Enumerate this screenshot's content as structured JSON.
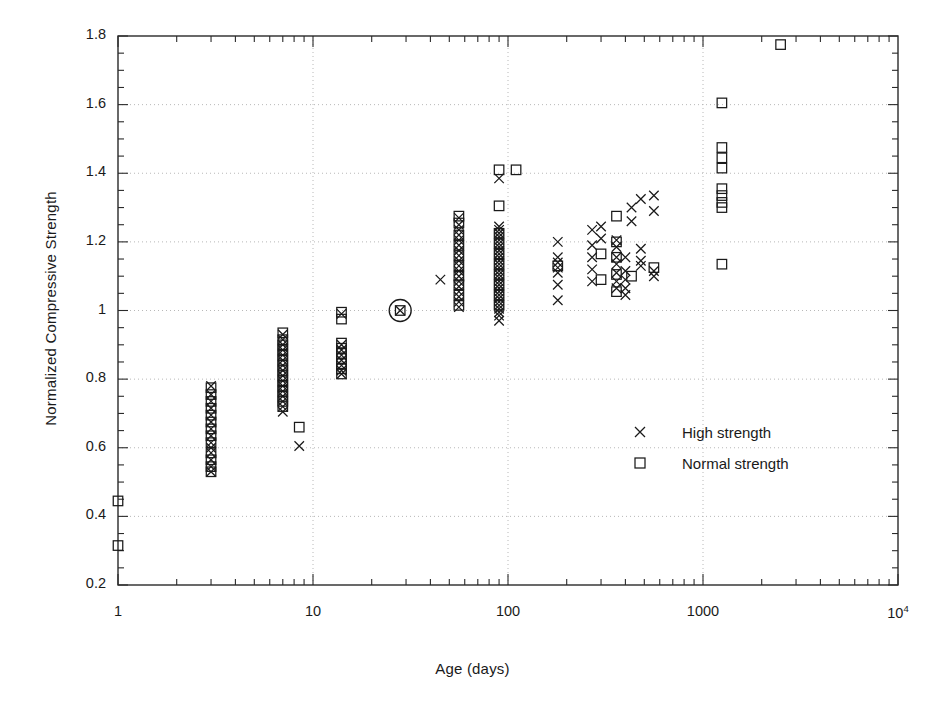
{
  "chart_data": {
    "type": "scatter",
    "title": "",
    "xlabel": "Age (days)",
    "ylabel": "Normalized Compressive Strength",
    "xscale": "log",
    "yscale": "linear",
    "xlim": [
      1,
      10000
    ],
    "ylim": [
      0.2,
      1.8
    ],
    "grid": true,
    "grid_style": "dotted",
    "legend_position": "center-right",
    "xtick_labels": [
      "1",
      "10",
      "100",
      "1000",
      "10",
      "4"
    ],
    "xticks": [
      1,
      10,
      100,
      1000,
      10000
    ],
    "yticks": [
      0.2,
      0.4,
      0.6,
      0.8,
      1.0,
      1.2,
      1.4,
      1.6,
      1.8
    ],
    "ytick_labels": [
      "0.2",
      "0.4",
      "0.6",
      "0.8",
      "1",
      "1.2",
      "1.4",
      "1.6",
      "1.8"
    ],
    "ytick_minor_step": 0.05,
    "annotations": [
      {
        "label": "reference-point-circle",
        "x": 28,
        "y": 1.0,
        "note": "circled 28-day normalization point"
      }
    ],
    "series": [
      {
        "name": "High strength",
        "marker": "x",
        "color": "#1a1a1a",
        "points": [
          [
            3,
            0.78
          ],
          [
            3,
            0.755
          ],
          [
            3,
            0.735
          ],
          [
            3,
            0.715
          ],
          [
            3,
            0.695
          ],
          [
            3,
            0.675
          ],
          [
            3,
            0.655
          ],
          [
            3,
            0.635
          ],
          [
            3,
            0.615
          ],
          [
            3,
            0.6
          ],
          [
            3,
            0.585
          ],
          [
            3,
            0.565
          ],
          [
            3,
            0.545
          ],
          [
            3,
            0.53
          ],
          [
            7,
            0.93
          ],
          [
            7,
            0.915
          ],
          [
            7,
            0.9
          ],
          [
            7,
            0.885
          ],
          [
            7,
            0.87
          ],
          [
            7,
            0.855
          ],
          [
            7,
            0.84
          ],
          [
            7,
            0.825
          ],
          [
            7,
            0.81
          ],
          [
            7,
            0.795
          ],
          [
            7,
            0.78
          ],
          [
            7,
            0.765
          ],
          [
            7,
            0.75
          ],
          [
            7,
            0.735
          ],
          [
            7,
            0.72
          ],
          [
            7,
            0.705
          ],
          [
            8.5,
            0.605
          ],
          [
            14,
            0.99
          ],
          [
            14,
            0.9
          ],
          [
            14,
            0.885
          ],
          [
            14,
            0.87
          ],
          [
            14,
            0.855
          ],
          [
            14,
            0.84
          ],
          [
            14,
            0.825
          ],
          [
            14,
            0.815
          ],
          [
            28,
            1.0
          ],
          [
            45,
            1.09
          ],
          [
            56,
            1.27
          ],
          [
            56,
            1.25
          ],
          [
            56,
            1.235
          ],
          [
            56,
            1.22
          ],
          [
            56,
            1.205
          ],
          [
            56,
            1.19
          ],
          [
            56,
            1.175
          ],
          [
            56,
            1.16
          ],
          [
            56,
            1.145
          ],
          [
            56,
            1.13
          ],
          [
            56,
            1.115
          ],
          [
            56,
            1.1
          ],
          [
            56,
            1.085
          ],
          [
            56,
            1.07
          ],
          [
            56,
            1.055
          ],
          [
            56,
            1.04
          ],
          [
            56,
            1.025
          ],
          [
            56,
            1.01
          ],
          [
            90,
            1.385
          ],
          [
            90,
            1.245
          ],
          [
            90,
            1.235
          ],
          [
            90,
            1.225
          ],
          [
            90,
            1.215
          ],
          [
            90,
            1.205
          ],
          [
            90,
            1.195
          ],
          [
            90,
            1.185
          ],
          [
            90,
            1.175
          ],
          [
            90,
            1.165
          ],
          [
            90,
            1.155
          ],
          [
            90,
            1.145
          ],
          [
            90,
            1.135
          ],
          [
            90,
            1.125
          ],
          [
            90,
            1.115
          ],
          [
            90,
            1.105
          ],
          [
            90,
            1.095
          ],
          [
            90,
            1.085
          ],
          [
            90,
            1.075
          ],
          [
            90,
            1.065
          ],
          [
            90,
            1.055
          ],
          [
            90,
            1.045
          ],
          [
            90,
            1.035
          ],
          [
            90,
            1.025
          ],
          [
            90,
            1.015
          ],
          [
            90,
            1.005
          ],
          [
            90,
            0.995
          ],
          [
            90,
            0.985
          ],
          [
            90,
            0.97
          ],
          [
            180,
            1.2
          ],
          [
            180,
            1.155
          ],
          [
            180,
            1.14
          ],
          [
            180,
            1.125
          ],
          [
            180,
            1.11
          ],
          [
            180,
            1.075
          ],
          [
            180,
            1.03
          ],
          [
            270,
            1.235
          ],
          [
            270,
            1.19
          ],
          [
            270,
            1.155
          ],
          [
            270,
            1.12
          ],
          [
            270,
            1.085
          ],
          [
            300,
            1.245
          ],
          [
            300,
            1.21
          ],
          [
            360,
            1.205
          ],
          [
            360,
            1.185
          ],
          [
            360,
            1.155
          ],
          [
            360,
            1.135
          ],
          [
            360,
            1.11
          ],
          [
            360,
            1.085
          ],
          [
            360,
            1.065
          ],
          [
            400,
            1.155
          ],
          [
            400,
            1.115
          ],
          [
            400,
            1.09
          ],
          [
            400,
            1.065
          ],
          [
            400,
            1.045
          ],
          [
            430,
            1.3
          ],
          [
            430,
            1.26
          ],
          [
            480,
            1.325
          ],
          [
            480,
            1.18
          ],
          [
            480,
            1.145
          ],
          [
            480,
            1.13
          ],
          [
            560,
            1.335
          ],
          [
            560,
            1.29
          ],
          [
            560,
            1.115
          ],
          [
            560,
            1.1
          ]
        ]
      },
      {
        "name": "Normal strength",
        "marker": "square",
        "color": "#1a1a1a",
        "points": [
          [
            1,
            0.445
          ],
          [
            1,
            0.315
          ],
          [
            3,
            0.775
          ],
          [
            3,
            0.755
          ],
          [
            3,
            0.735
          ],
          [
            3,
            0.715
          ],
          [
            3,
            0.695
          ],
          [
            3,
            0.675
          ],
          [
            3,
            0.655
          ],
          [
            3,
            0.635
          ],
          [
            3,
            0.615
          ],
          [
            3,
            0.585
          ],
          [
            3,
            0.565
          ],
          [
            3,
            0.545
          ],
          [
            3,
            0.53
          ],
          [
            7,
            0.935
          ],
          [
            7,
            0.915
          ],
          [
            7,
            0.9
          ],
          [
            7,
            0.885
          ],
          [
            7,
            0.87
          ],
          [
            7,
            0.855
          ],
          [
            7,
            0.84
          ],
          [
            7,
            0.825
          ],
          [
            7,
            0.81
          ],
          [
            7,
            0.795
          ],
          [
            7,
            0.78
          ],
          [
            7,
            0.765
          ],
          [
            7,
            0.75
          ],
          [
            7,
            0.735
          ],
          [
            7,
            0.72
          ],
          [
            8.5,
            0.66
          ],
          [
            14,
            0.995
          ],
          [
            14,
            0.975
          ],
          [
            14,
            0.905
          ],
          [
            14,
            0.89
          ],
          [
            14,
            0.875
          ],
          [
            14,
            0.86
          ],
          [
            14,
            0.845
          ],
          [
            14,
            0.83
          ],
          [
            14,
            0.815
          ],
          [
            28,
            1.0
          ],
          [
            56,
            1.275
          ],
          [
            56,
            1.255
          ],
          [
            56,
            1.22
          ],
          [
            56,
            1.19
          ],
          [
            56,
            1.16
          ],
          [
            56,
            1.13
          ],
          [
            56,
            1.1
          ],
          [
            56,
            1.075
          ],
          [
            56,
            1.045
          ],
          [
            56,
            1.015
          ],
          [
            90,
            1.41
          ],
          [
            90,
            1.305
          ],
          [
            110,
            1.41
          ],
          [
            90,
            1.225
          ],
          [
            90,
            1.195
          ],
          [
            90,
            1.165
          ],
          [
            90,
            1.135
          ],
          [
            90,
            1.105
          ],
          [
            90,
            1.075
          ],
          [
            90,
            1.045
          ],
          [
            90,
            1.015
          ],
          [
            180,
            1.13
          ],
          [
            300,
            1.165
          ],
          [
            300,
            1.09
          ],
          [
            360,
            1.275
          ],
          [
            360,
            1.2
          ],
          [
            360,
            1.155
          ],
          [
            360,
            1.105
          ],
          [
            360,
            1.055
          ],
          [
            430,
            1.1
          ],
          [
            560,
            1.125
          ],
          [
            1250,
            1.605
          ],
          [
            1250,
            1.475
          ],
          [
            1250,
            1.445
          ],
          [
            1250,
            1.415
          ],
          [
            1250,
            1.355
          ],
          [
            1250,
            1.335
          ],
          [
            1250,
            1.315
          ],
          [
            1250,
            1.3
          ],
          [
            1250,
            1.135
          ],
          [
            2500,
            1.775
          ]
        ]
      }
    ],
    "legend": [
      {
        "label": "High strength",
        "marker": "x"
      },
      {
        "label": "Normal strength",
        "marker": "square"
      }
    ]
  }
}
